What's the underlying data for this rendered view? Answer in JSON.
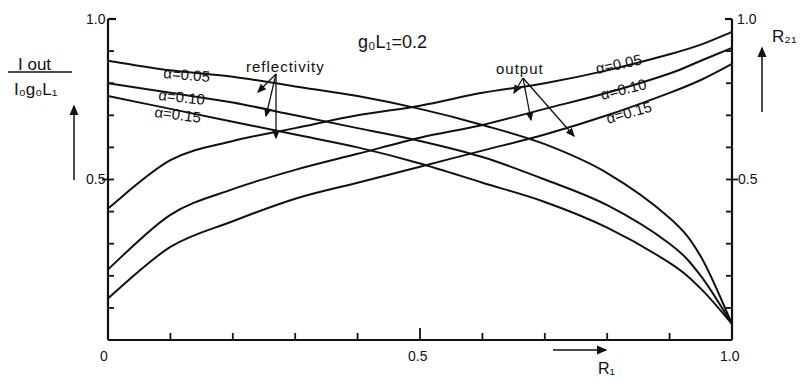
{
  "chart_data": {
    "type": "line",
    "xlabel": "R1",
    "ylabel_left": "Iout / (I0 g0 L1)",
    "ylabel_right": "R21",
    "xlim": [
      0,
      1.0
    ],
    "ylim": [
      0,
      1.0
    ],
    "x_ticks": [
      0,
      0.1,
      0.2,
      0.3,
      0.4,
      0.5,
      0.6,
      0.7,
      0.8,
      0.9,
      1.0
    ],
    "x_tick_labels": [
      "0",
      "0.5",
      "1.0"
    ],
    "y_ticks": [
      0,
      0.1,
      0.2,
      0.3,
      0.4,
      0.5,
      0.6,
      0.7,
      0.8,
      0.9,
      1.0
    ],
    "y_tick_labels_left": [
      "0.5",
      "1.0"
    ],
    "y_tick_labels_right": [
      "0.5",
      "1.0"
    ],
    "grid": false,
    "annotations": [
      "reflectivity",
      "output"
    ],
    "x": [
      0,
      0.1,
      0.2,
      0.3,
      0.4,
      0.5,
      0.6,
      0.7,
      0.8,
      0.9,
      0.95,
      1.0
    ],
    "series": [
      {
        "name": "reflectivity α=0.05",
        "group": "reflectivity",
        "alpha": "0.05",
        "axis": "right",
        "values": [
          0.87,
          0.84,
          0.82,
          0.79,
          0.76,
          0.72,
          0.67,
          0.61,
          0.52,
          0.38,
          0.26,
          0.05
        ]
      },
      {
        "name": "reflectivity α=0.10",
        "group": "reflectivity",
        "alpha": "0.10",
        "axis": "right",
        "values": [
          0.8,
          0.77,
          0.74,
          0.7,
          0.66,
          0.62,
          0.57,
          0.5,
          0.42,
          0.3,
          0.2,
          0.05
        ]
      },
      {
        "name": "reflectivity α=0.15",
        "group": "reflectivity",
        "alpha": "0.15",
        "axis": "right",
        "values": [
          0.76,
          0.72,
          0.68,
          0.64,
          0.6,
          0.55,
          0.49,
          0.43,
          0.35,
          0.24,
          0.16,
          0.05
        ]
      },
      {
        "name": "output α=0.05",
        "group": "output",
        "alpha": "0.05",
        "axis": "left",
        "values": [
          0.41,
          0.56,
          0.62,
          0.66,
          0.7,
          0.73,
          0.77,
          0.8,
          0.84,
          0.89,
          0.92,
          0.96
        ]
      },
      {
        "name": "output α=0.10",
        "group": "output",
        "alpha": "0.10",
        "axis": "left",
        "values": [
          0.22,
          0.39,
          0.47,
          0.53,
          0.58,
          0.63,
          0.67,
          0.72,
          0.77,
          0.83,
          0.87,
          0.91
        ]
      },
      {
        "name": "output α=0.15",
        "group": "output",
        "alpha": "0.15",
        "axis": "left",
        "values": [
          0.13,
          0.29,
          0.37,
          0.44,
          0.49,
          0.54,
          0.59,
          0.64,
          0.7,
          0.77,
          0.81,
          0.86
        ]
      }
    ]
  },
  "labels": {
    "title": "g₀L₁=0.2",
    "y_left_num": "I out",
    "y_left_den": "I₀g₀L₁",
    "y_right": "R₂₁",
    "x_axis": "R₁",
    "reflectivity": "reflectivity",
    "output": "output",
    "tick_x_0": "0",
    "tick_x_05": "0.5",
    "tick_x_1": "1.0",
    "tick_yl_05": "0.5",
    "tick_yl_1": "1.0",
    "tick_yr_05": "0.5",
    "tick_yr_1": "1.0",
    "refl_a005": "α=0.05",
    "refl_a010": "α=0.10",
    "refl_a015": "α=0.15",
    "out_a005": "α=0.05",
    "out_a010": "α=0.10",
    "out_a015": "α=0.15"
  }
}
